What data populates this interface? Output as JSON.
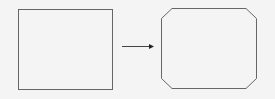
{
  "diagram": {
    "colors": {
      "background": "#f4f4f4",
      "stroke": "#555555",
      "arrow": "#222222"
    },
    "shapes": [
      {
        "id": "source",
        "type": "square",
        "label": ""
      },
      {
        "id": "target",
        "type": "chamfered-rectangle",
        "label": ""
      }
    ],
    "connector": {
      "type": "arrow",
      "direction": "right"
    }
  }
}
